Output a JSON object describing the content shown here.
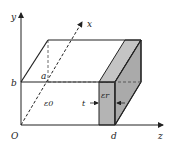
{
  "diagram": {
    "type": "3d-capacitor-slab",
    "axes": {
      "x_label": "x",
      "y_label": "y",
      "z_label": "z",
      "origin_label": "O"
    },
    "points": {
      "a_label": "a",
      "b_label": "b",
      "d_label": "d"
    },
    "regions": {
      "vacuum_label": "ε0",
      "dielectric_label": "εr",
      "thickness_label": "t"
    },
    "colors": {
      "line": "#222222",
      "dielectric_fill": "#b4b4b4",
      "background": "#ffffff"
    }
  }
}
